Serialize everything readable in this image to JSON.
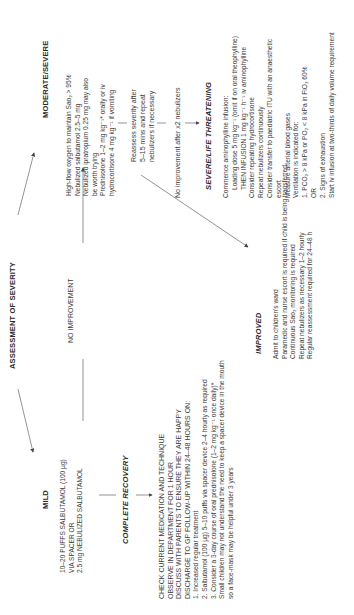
{
  "title": "ASSESSMENT OF SEVERITY",
  "branches": {
    "moderate": {
      "heading": "MODERATE/SEVERE",
      "lines": [
        "High-flow oxygen to maintain Sao₂ > 95%",
        "Nebulized salbutamol 2.5–5 mg",
        "Nebulized ipratropium 0.25 mg may also",
        "be worth trying",
        "Prednisolone 1–2 mg kg⁻¹* orally or iv",
        "hydrocortisone 4 mg kg⁻¹ if vomiting"
      ]
    },
    "mild": {
      "heading": "MILD",
      "lines": [
        "10–20 PUFFS SALBUTAMOL (100 µg)",
        "VIA SPACER OR",
        "2.5 mg NEBULIZED SALBUTAMOL"
      ]
    }
  },
  "no_improvement_label": "NO IMPROVEMENT",
  "complete_recovery": {
    "heading": "COMPLETE RECOVERY",
    "lines": [
      "CHECK CURRENT MEDICATION AND TECHNIQUE",
      "OBSERVE IN DEPARTMENT FOR 1 HOUR",
      "DISCUSS WITH PARENTS TO ENSURE THEY ARE HAPPY",
      "DISCHARGE TO GP FOLLOW-UP WITHIN 24–48 HOURS ON:",
      "1. Increased regular treatment",
      "2. Salbutamol (100 µg) 5–10 puffs via spacer device 2–4 hourly as required",
      "3. Consider a 3-day course of oral prednisolone (1–2 mg kg⁻¹ once daily)*",
      "Small children may not understand the need to keep a spacer device in the mouth",
      "so a face-mask may be helpful under 3 years"
    ]
  },
  "reassess": {
    "lines": [
      "Reassess severity after",
      "5–15 mins and repeat",
      "nebulizers if necessary"
    ]
  },
  "improved": {
    "heading": "IMPROVED",
    "lines": [
      "Admit to children's ward",
      "Paramedic and nurse escort is required if child is being transferred",
      "Continuous Sao₂ monitoring is required",
      "Repeat nebulizers as necessary 1–2 hourly",
      "Regular reassessment required for 24–48 h"
    ]
  },
  "no_improvement_x2": "No improvement after x2 nebulizers",
  "severe": {
    "heading": "SEVERE/LIFE THREATENING",
    "lines": [
      "Commence aminophylline infusion:",
      "Loading dose 5 mg kg⁻¹ (omit if on oral theophylline)",
      "THEN INFUSION 1 mg kg⁻¹ h⁻¹ iv aminophylline",
      "Consider repeating hydrocortisone",
      "Repeat nebulizers continuously",
      "Consider transfer to paediatric ITU with an anaesthetic",
      "escort",
      "Measure arterial blood gases",
      "Ventilation is indicated for:",
      "1. PCO₂ > 8 kPa or PO₂ < 8 kPa in FiO₂ 60%",
      "OR",
      "2. Signs of exhaustion",
      "Start iv infusion at two-thirds of daily volume requirement"
    ]
  },
  "colors": {
    "text": "#3a3a3a",
    "heading": "#2a2a2a",
    "line": "#555555",
    "background": "#ffffff"
  }
}
